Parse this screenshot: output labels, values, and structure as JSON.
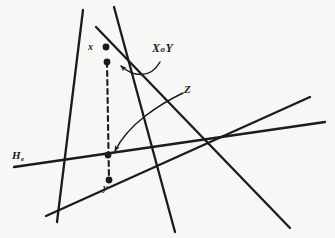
{
  "figure": {
    "background_color": "#f7f7f6",
    "ink_color": "#1b1b1b",
    "width": 335,
    "height": 238,
    "labels": {
      "point_x": "x",
      "point_y": "y",
      "line_z": "Z",
      "set_xoy_first": "X",
      "set_xoy_middle": "o",
      "set_xoy_last": "Y",
      "hyperplane_h": "H",
      "hyperplane_h_subscript": "e"
    },
    "points": [
      {
        "name": "x",
        "cx": 106,
        "cy": 47
      },
      {
        "name": "upper-interior-point",
        "cx": 107,
        "cy": 62
      },
      {
        "name": "lower-interior-point",
        "cx": 108,
        "cy": 155
      },
      {
        "name": "y",
        "cx": 109,
        "cy": 180
      }
    ],
    "lines": [
      {
        "name": "left-cone-edge",
        "x1": 83,
        "y1": 10,
        "x2": 57,
        "y2": 222
      },
      {
        "name": "right-cone-edge",
        "x1": 114,
        "y1": 7,
        "x2": 175,
        "y2": 232
      },
      {
        "name": "descending-diagonal",
        "x1": 96,
        "y1": 27,
        "x2": 290,
        "y2": 228
      },
      {
        "name": "hyperplane-He",
        "x1": 14,
        "y1": 167,
        "x2": 325,
        "y2": 122
      },
      {
        "name": "lower-ascending-line",
        "x1": 46,
        "y1": 216,
        "x2": 310,
        "y2": 97
      }
    ],
    "dashed_segment": {
      "name": "vertical-dashed-segment",
      "x1": 107,
      "y1": 62,
      "x2": 109,
      "y2": 180
    },
    "annotation_arrows": [
      {
        "name": "xoy-callout-arrow",
        "from": "XoY label",
        "to": "upper-interior-point"
      },
      {
        "name": "z-callout-arrow",
        "from": "Z label",
        "to": "lower-interior-point"
      },
      {
        "name": "he-callout-leader",
        "from": "He label",
        "to": "hyperplane line"
      }
    ]
  }
}
